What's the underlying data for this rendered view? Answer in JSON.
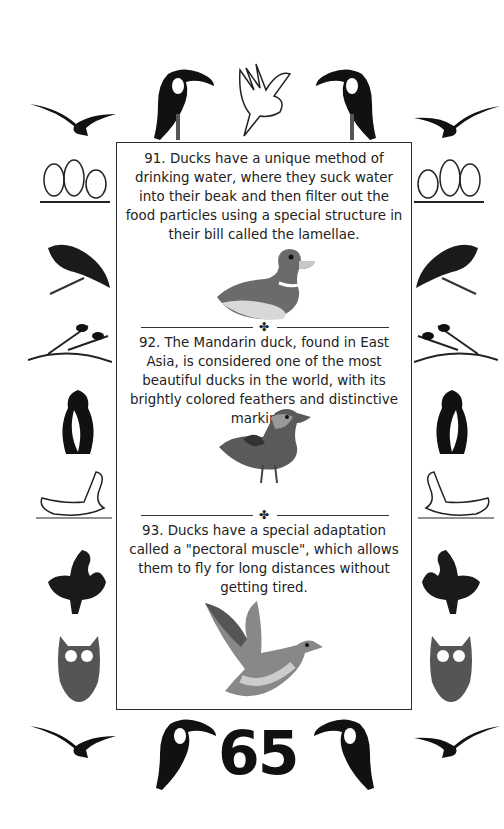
{
  "page": {
    "page_number": "65",
    "facts": [
      {
        "id": 91,
        "text": "91. Ducks have a unique method of drinking water, where they suck water into their beak and then filter out the food particles using a special structure in their bill called the lamellae.",
        "image": "duck-icon-illustration"
      },
      {
        "id": 92,
        "text": "92. The Mandarin duck, found in East Asia, is considered one of the most beautiful ducks in the world, with its brightly colored feathers and distinctive markings.",
        "image": "mandarin-duck-illustration"
      },
      {
        "id": 93,
        "text": "93. Ducks have a special adaptation called a \"pectoral muscle\", which allows them to fly for long distances without getting tired.",
        "image": "flying-mallard-illustration"
      }
    ],
    "divider_ornament": "✤",
    "border_birds": [
      "toucan",
      "cockatoo",
      "seagull",
      "lovebirds",
      "parrot",
      "branch-birds",
      "penguin",
      "swan",
      "rooster",
      "owl"
    ]
  }
}
